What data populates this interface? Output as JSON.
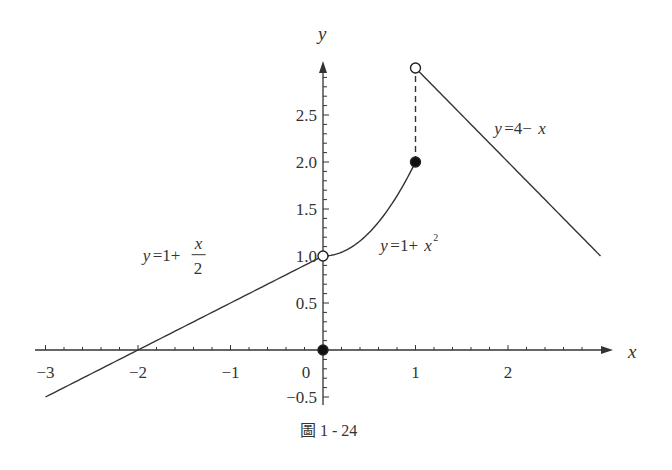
{
  "chart_data": {
    "type": "line",
    "title": "",
    "caption": "圖 1 - 24",
    "xlabel": "x",
    "ylabel": "y",
    "xlim": [
      -3.1,
      3.1
    ],
    "ylim": [
      -0.55,
      3.05
    ],
    "grid": false,
    "x_ticks": [
      {
        "value": -3,
        "label": "−3"
      },
      {
        "value": -2,
        "label": "−2"
      },
      {
        "value": -1,
        "label": "−1"
      },
      {
        "value": 0,
        "label": "0"
      },
      {
        "value": 1,
        "label": "1"
      },
      {
        "value": 2,
        "label": "2"
      }
    ],
    "x_minor_step": 0.2,
    "y_ticks": [
      {
        "value": -0.5,
        "label": "−0.5"
      },
      {
        "value": 0.5,
        "label": "0.5"
      },
      {
        "value": 1.0,
        "label": "1.0"
      },
      {
        "value": 1.5,
        "label": "1.5"
      },
      {
        "value": 2.0,
        "label": "2.0"
      },
      {
        "value": 2.5,
        "label": "2.5"
      }
    ],
    "y_minor_step": 0.1,
    "series": [
      {
        "name": "y=1+x/2",
        "function": "1+x/2",
        "domain": [
          -3,
          0
        ],
        "style": "solid"
      },
      {
        "name": "y=1+x^2",
        "function": "1+x^2",
        "domain": [
          0,
          1
        ],
        "style": "solid"
      },
      {
        "name": "y=4-x",
        "function": "4-x",
        "domain": [
          1,
          3
        ],
        "style": "solid"
      },
      {
        "name": "jump",
        "points": [
          [
            1,
            2
          ],
          [
            1,
            3
          ]
        ],
        "style": "dashed"
      }
    ],
    "points": [
      {
        "x": 0,
        "y": 1,
        "marker": "open"
      },
      {
        "x": 0,
        "y": 0,
        "marker": "filled"
      },
      {
        "x": 1,
        "y": 2,
        "marker": "filled"
      },
      {
        "x": 1,
        "y": 3,
        "marker": "open"
      }
    ],
    "annotations": [
      {
        "id": "label1",
        "pre": "y",
        "mid": "=1+",
        "num": "x",
        "den": "2",
        "at": [
          -1.95,
          0.95
        ]
      },
      {
        "id": "label2",
        "pre": "y",
        "mid": "=1+",
        "var": "x",
        "sup": "2",
        "at": [
          0.62,
          1.05
        ]
      },
      {
        "id": "label3",
        "pre": "y",
        "mid": "=4−",
        "var": "x",
        "at": [
          1.85,
          2.3
        ]
      }
    ]
  }
}
